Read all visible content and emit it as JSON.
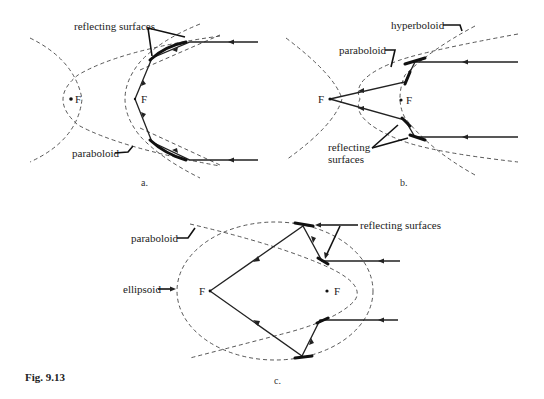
{
  "figure": {
    "caption": "Fig. 9.13",
    "panels": [
      {
        "id": "a",
        "label": "a.",
        "labels": {
          "reflecting_surfaces": "reflecting surfaces",
          "paraboloid": "paraboloid",
          "focus_left": "F",
          "focus_right": "F"
        }
      },
      {
        "id": "b",
        "label": "b.",
        "labels": {
          "hyperboloid": "hyperboloid",
          "paraboloid": "paraboloid",
          "reflecting_line1": "reflecting",
          "reflecting_line2": "surfaces",
          "focus_left": "F",
          "focus_right": "F"
        }
      },
      {
        "id": "c",
        "label": "c.",
        "labels": {
          "paraboloid": "paraboloid",
          "ellipsoid": "ellipsoid",
          "reflecting_surfaces": "reflecting surfaces",
          "focus_left": "F",
          "focus_right": "F"
        }
      }
    ]
  },
  "colors": {
    "background": "#ffffff",
    "line": "#222222"
  }
}
